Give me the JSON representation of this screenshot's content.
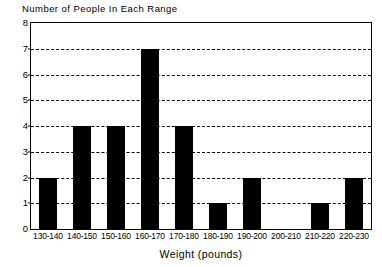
{
  "chart_data": {
    "type": "bar",
    "title": "Number of People In Each Range",
    "xlabel": "Weight (pounds)",
    "ylabel": "",
    "categories": [
      "130-140",
      "140-150",
      "150-160",
      "160-170",
      "170-180",
      "180-190",
      "190-200",
      "200-210",
      "210-220",
      "220-230"
    ],
    "values": [
      2,
      4,
      4,
      7,
      4,
      1,
      2,
      0,
      1,
      2
    ],
    "ylim": [
      0,
      8
    ],
    "yticks": [
      0,
      1,
      2,
      3,
      4,
      5,
      6,
      7,
      8
    ],
    "ytick_labels": [
      "0",
      "1",
      "2",
      "3",
      "4",
      "5",
      "6",
      "7",
      "8"
    ],
    "grid": true,
    "grid_axis": "y",
    "grid_style": "dashed",
    "legend": false,
    "bar_color": "#000000",
    "frame_color": "#000000",
    "background_color": "#ffffff"
  }
}
